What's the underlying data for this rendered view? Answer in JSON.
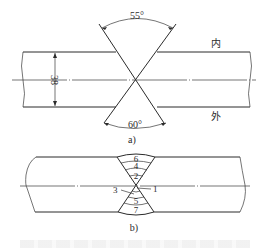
{
  "figure_a": {
    "label": "a)",
    "top_angle": "55°",
    "bottom_angle": "60°",
    "thickness": "38",
    "inner_side_label": "内",
    "outer_side_label": "外"
  },
  "figure_b": {
    "label": "b)",
    "weld_passes": [
      "1",
      "2",
      "3",
      "4",
      "5",
      "6",
      "7"
    ]
  }
}
